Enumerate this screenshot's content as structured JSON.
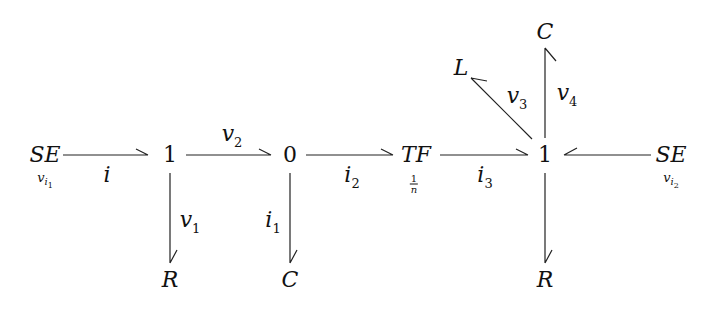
{
  "diagram": {
    "type": "bond-graph",
    "nodes": {
      "se_left": {
        "label": "SE",
        "sub_var": "v",
        "sub_idx": "i",
        "sub_idx_num": "1"
      },
      "junction1_left": {
        "label": "1"
      },
      "junction0": {
        "label": "0"
      },
      "tf": {
        "label": "TF",
        "ratio_num": "1",
        "ratio_den": "n"
      },
      "junction1_right": {
        "label": "1"
      },
      "se_right": {
        "label": "SE",
        "sub_var": "v",
        "sub_idx": "i",
        "sub_idx_num": "2"
      },
      "r_left": {
        "label": "R"
      },
      "c_mid": {
        "label": "C"
      },
      "r_right": {
        "label": "R"
      },
      "l_top": {
        "label": "L"
      },
      "c_top": {
        "label": "C"
      }
    },
    "bonds": {
      "b_i": {
        "var": "i",
        "sub": ""
      },
      "b_v2": {
        "var": "v",
        "sub": "2"
      },
      "b_i2": {
        "var": "i",
        "sub": "2"
      },
      "b_i3": {
        "var": "i",
        "sub": "3"
      },
      "b_v1": {
        "var": "v",
        "sub": "1"
      },
      "b_i1": {
        "var": "i",
        "sub": "1"
      },
      "b_v3": {
        "var": "v",
        "sub": "3"
      },
      "b_v4": {
        "var": "v",
        "sub": "4"
      }
    }
  }
}
